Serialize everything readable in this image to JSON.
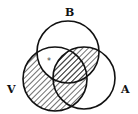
{
  "diagram": {
    "type": "venn-3",
    "sets": [
      {
        "label": "B",
        "cx": 68,
        "cy": 52,
        "r": 31
      },
      {
        "label": "V",
        "cx": 55,
        "cy": 79,
        "r": 32
      },
      {
        "label": "A",
        "cx": 84,
        "cy": 78,
        "r": 31
      }
    ],
    "labels": {
      "b": "B",
      "v": "V",
      "a": "A"
    },
    "marker": "*",
    "shaded_regions": [
      "V only",
      "V∩A−B",
      "V∩A∩B",
      "A∩B−V"
    ],
    "unshaded_marked_region": "V∩B−A",
    "colors": {
      "stroke": "#111111",
      "hatch": "#222222",
      "background": "#ffffff"
    }
  }
}
